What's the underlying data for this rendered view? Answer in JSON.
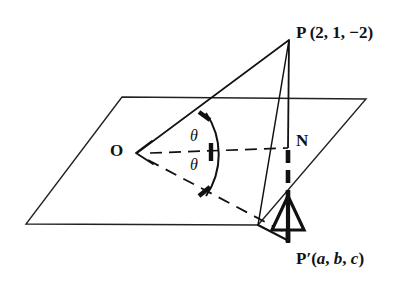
{
  "figure": {
    "background_color": "#ffffff",
    "stroke_color": "#111111",
    "labels": {
      "origin": "O",
      "foot_of_perpendicular": "N",
      "point_p": "P",
      "point_p_coords": "(2, 1, −2)",
      "point_p_full": "P (2, 1, −2)",
      "point_p_prime": "P′",
      "point_p_prime_coords_open": "(",
      "point_p_prime_a": "a",
      "point_p_prime_sep1": ", ",
      "point_p_prime_b": "b",
      "point_p_prime_sep2": ", ",
      "point_p_prime_c": "c",
      "point_p_prime_coords_close": ")",
      "point_p_prime_full": "P′(a, b, c)",
      "angle_upper": "θ",
      "angle_lower": "θ"
    },
    "geometry": {
      "plane_corners": [
        {
          "name": "top-left",
          "x": 122,
          "y": 97
        },
        {
          "name": "top-right",
          "x": 366,
          "y": 99
        },
        {
          "name": "bottom-right",
          "x": 258,
          "y": 225
        },
        {
          "name": "bottom-left",
          "x": 26,
          "y": 224
        }
      ],
      "points": {
        "O": {
          "x": 137,
          "y": 153
        },
        "P": {
          "x": 289,
          "y": 40
        },
        "N": {
          "x": 288,
          "y": 148
        },
        "Pp": {
          "x": 288,
          "y": 240
        }
      },
      "solid_segments": [
        {
          "name": "O-to-P",
          "x1": 137,
          "y1": 153,
          "x2": 289,
          "y2": 40
        },
        {
          "name": "P-to-N-to-Pp",
          "x1": 289,
          "y1": 40,
          "x2": 288,
          "y2": 240
        },
        {
          "name": "P-to-plane-edge",
          "x1": 289,
          "y1": 40,
          "x2": 258,
          "y2": 225
        },
        {
          "name": "plane-edge-to-Pp",
          "x1": 258,
          "y1": 225,
          "x2": 288,
          "y2": 240
        }
      ],
      "dashed_segments": [
        {
          "name": "O-to-N",
          "x1": 137,
          "y1": 153,
          "x2": 288,
          "y2": 148
        },
        {
          "name": "O-to-Pp",
          "x1": 137,
          "y1": 153,
          "x2": 288,
          "y2": 233
        }
      ],
      "thick_dashed_segment": {
        "name": "N-to-Pp",
        "x1": 288,
        "y1": 148,
        "x2": 288,
        "y2": 240
      },
      "arrowheads": [
        {
          "name": "arrow-at-O",
          "points_to": "O",
          "direction": "left",
          "style": "open-v"
        },
        {
          "name": "arrow-up-on-NPp",
          "points_to": "N",
          "direction": "up",
          "style": "hollow-triangle"
        }
      ],
      "angle_arc": {
        "vertex": "O",
        "from_ray": "O-to-P",
        "through_ray": "O-to-N",
        "to_ray": "O-to-Pp",
        "tick_count": 3
      }
    }
  }
}
